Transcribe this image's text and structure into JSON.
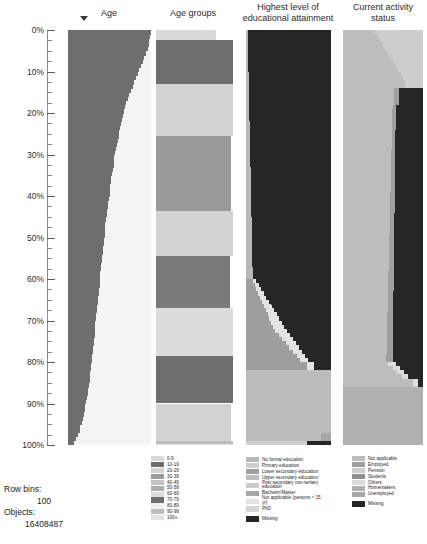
{
  "chart_data": {
    "type": "area",
    "title": "",
    "xlabel": "",
    "ylabel": "Percentile of rows",
    "ylim": [
      0,
      100
    ],
    "grid": false,
    "legend_position": "bottom",
    "row_bins": 100,
    "objects": 16408487,
    "columns": [
      {
        "name": "Age",
        "type": "continuous-sorted",
        "description": "Sorted age distribution rendered as a filled curve; fill extends from left, width decreases with percentile.",
        "fill_color": "#6e6e6e",
        "background_color": "#f2f2f2",
        "curve_widths_percent": [
          100,
          99,
          98,
          97,
          96,
          94,
          92,
          90,
          88,
          86,
          84,
          82,
          80,
          78,
          76,
          74,
          72,
          70,
          69,
          67,
          66,
          65,
          64,
          63,
          62,
          61,
          60,
          59,
          58,
          57,
          56,
          55,
          55,
          54,
          53,
          52,
          52,
          51,
          50,
          50,
          49,
          48,
          48,
          47,
          47,
          46,
          45,
          45,
          44,
          44,
          43,
          43,
          42,
          42,
          41,
          41,
          40,
          40,
          39,
          39,
          38,
          38,
          37,
          37,
          36,
          36,
          35,
          35,
          34,
          34,
          33,
          33,
          32,
          32,
          31,
          31,
          30,
          30,
          29,
          29,
          28,
          28,
          27,
          26,
          26,
          25,
          24,
          24,
          23,
          22,
          21,
          20,
          19,
          18,
          17,
          15,
          14,
          12,
          10,
          7
        ]
      },
      {
        "name": "Age groups",
        "type": "categorical-bins",
        "description": "Decade age bins stacked by percentile of sorted rows.",
        "bins": [
          {
            "label": "0-9",
            "color": "#d9d9d9",
            "start_percent": 0.0,
            "end_percent": 2.5
          },
          {
            "label": "10-19",
            "color": "#6e6e6e",
            "start_percent": 2.5,
            "end_percent": 13.0
          },
          {
            "label": "20-29",
            "color": "#d2d2d2",
            "start_percent": 13.0,
            "end_percent": 25.5
          },
          {
            "label": "30-39",
            "color": "#9a9a9a",
            "start_percent": 25.5,
            "end_percent": 43.5
          },
          {
            "label": "40-49",
            "color": "#d2d2d2",
            "start_percent": 43.5,
            "end_percent": 54.5
          },
          {
            "label": "50-59",
            "color": "#7a7a7a",
            "start_percent": 54.5,
            "end_percent": 67.0
          },
          {
            "label": "60-69",
            "color": "#dcdcdc",
            "start_percent": 67.0,
            "end_percent": 78.5
          },
          {
            "label": "70-79",
            "color": "#6e6e6e",
            "start_percent": 78.5,
            "end_percent": 90.0
          },
          {
            "label": "80-89",
            "color": "#d2d2d2",
            "start_percent": 90.0,
            "end_percent": 99.0
          },
          {
            "label": "90-99",
            "color": "#bdbdbd",
            "start_percent": 99.0,
            "end_percent": 99.8
          },
          {
            "label": "100+",
            "color": "#e2e2e2",
            "start_percent": 99.8,
            "end_percent": 100.0
          }
        ]
      },
      {
        "name": "Highest level of educational attainment",
        "type": "categorical-stacked",
        "description": "Educational attainment categories; large dark Missing region at top right, Not applicable band lower.",
        "categories": [
          {
            "label": "No formal education",
            "color": "#b8b8b8"
          },
          {
            "label": "Primary education",
            "color": "#cfcfcf"
          },
          {
            "label": "Lower secondary education",
            "color": "#9e9e9e"
          },
          {
            "label": "Upper secondary education",
            "color": "#bcbcbc"
          },
          {
            "label": "Post secondary non-tertiary education",
            "color": "#cacaca"
          },
          {
            "label": "Bachelor/Master",
            "color": "#a6a6a6"
          },
          {
            "label": "Not applicable (persons < 15 yr)",
            "color": "#e3e3e3"
          },
          {
            "label": "PhD",
            "color": "#d6d6d6"
          },
          {
            "label": "Missing",
            "color": "#262626"
          }
        ]
      },
      {
        "name": "Current activity status",
        "type": "categorical-stacked",
        "description": "Activity status categories; Not applicable dominant light band with dark Missing wedge on the right.",
        "categories": [
          {
            "label": "Not applicable",
            "color": "#bdbdbd"
          },
          {
            "label": "Employed",
            "color": "#9f9f9f"
          },
          {
            "label": "Pension",
            "color": "#cdcdcd"
          },
          {
            "label": "Students",
            "color": "#8f8f8f"
          },
          {
            "label": "Others",
            "color": "#dcdcdc"
          },
          {
            "label": "Homemakers",
            "color": "#b0b0b0"
          },
          {
            "label": "Unemployed",
            "color": "#a8a8a8"
          },
          {
            "label": "Missing",
            "color": "#262626"
          }
        ]
      }
    ],
    "axis_ticks": [
      "0%",
      "10%",
      "20%",
      "30%",
      "40%",
      "50%",
      "60%",
      "70%",
      "80%",
      "90%",
      "100%"
    ]
  },
  "headers": {
    "age": "Age",
    "age_groups": "Age groups",
    "education_line1": "Highest level of",
    "education_line2": "educational attainment",
    "activity_line1": "Current activity",
    "activity_line2": "status"
  },
  "legends": {
    "age_groups": [
      {
        "label": "0-9",
        "color": "#d9d9d9"
      },
      {
        "label": "10-19",
        "color": "#6e6e6e"
      },
      {
        "label": "20-29",
        "color": "#d2d2d2"
      },
      {
        "label": "30-39",
        "color": "#9a9a9a"
      },
      {
        "label": "40-49",
        "color": "#c4c4c4"
      },
      {
        "label": "50-59",
        "color": "#adadad"
      },
      {
        "label": "60-69",
        "color": "#dcdcdc"
      },
      {
        "label": "70-79",
        "color": "#6e6e6e"
      },
      {
        "label": "80-89",
        "color": "#f0f0f0"
      },
      {
        "label": "90-99",
        "color": "#bdbdbd"
      },
      {
        "label": "100+",
        "color": "#e2e2e2"
      }
    ],
    "education": [
      {
        "label": "No formal education",
        "color": "#b8b8b8"
      },
      {
        "label": "Primary education",
        "color": "#cfcfcf"
      },
      {
        "label": "Lower secondary education",
        "color": "#9e9e9e"
      },
      {
        "label": "Upper secondary education",
        "color": "#bcbcbc"
      },
      {
        "label": "Post secondary non-tertiary education",
        "color": "#cacaca"
      },
      {
        "label": "Bachelor/Master",
        "color": "#a6a6a6"
      },
      {
        "label": "Not applicable (persons < 15 yr)",
        "color": "#e3e3e3"
      },
      {
        "label": "PhD",
        "color": "#d6d6d6"
      }
    ],
    "education_missing": {
      "label": "Missing",
      "color": "#262626"
    },
    "activity": [
      {
        "label": "Not applicable",
        "color": "#bdbdbd"
      },
      {
        "label": "Employed",
        "color": "#9f9f9f"
      },
      {
        "label": "Pension",
        "color": "#cdcdcd"
      },
      {
        "label": "Students",
        "color": "#8f8f8f"
      },
      {
        "label": "Others",
        "color": "#dcdcdc"
      },
      {
        "label": "Homemakers",
        "color": "#b0b0b0"
      },
      {
        "label": "Unemployed",
        "color": "#a8a8a8"
      }
    ],
    "activity_missing": {
      "label": "Missing",
      "color": "#262626"
    }
  },
  "stats": {
    "row_bins_label": "Row bins:",
    "row_bins_value": "100",
    "objects_label": "Objects:",
    "objects_value": "16408487"
  }
}
